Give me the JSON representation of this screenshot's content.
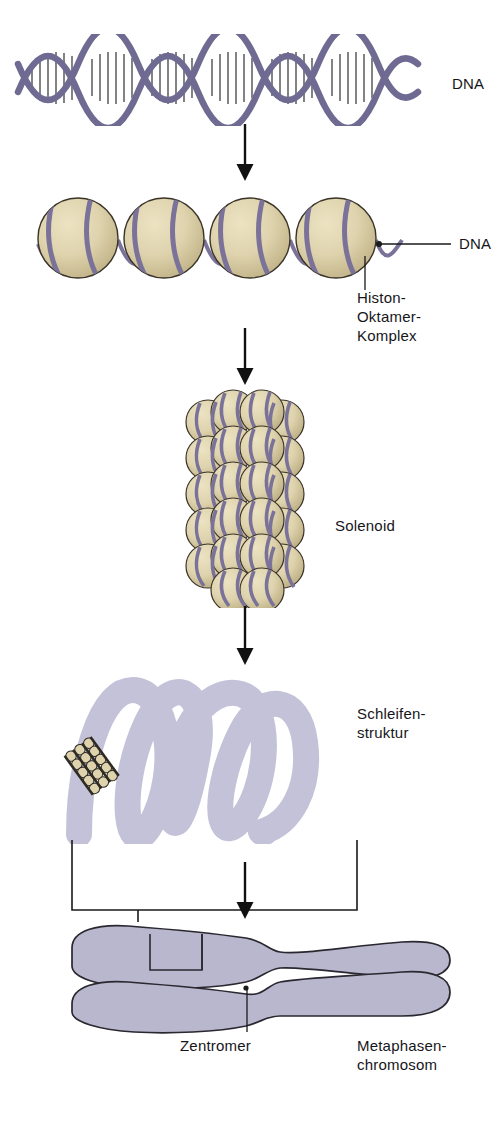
{
  "figure": {
    "title_visible": false,
    "language": "de",
    "background": "#ffffff",
    "colors": {
      "dna_helix": "#6f6a92",
      "helix_rung": "#1d1d22",
      "histone_sphere": "#ded3ad",
      "histone_sphere_shade": "#c9bc8f",
      "histone_outline": "#3a3328",
      "dna_wrap": "#7a7299",
      "loop_structure": "#c3c2d8",
      "chromosome_fill": "#b9b7cd",
      "chromosome_outline": "#2a2730",
      "arrow": "#111111",
      "leader_line": "#1a1a1a",
      "mini_solenoid_dark": "#2e2b24",
      "mini_solenoid_bead": "#ded3ad"
    }
  },
  "stages": [
    {
      "id": "dna-double-helix",
      "label": "DNA",
      "label_x": 452,
      "label_y": 83,
      "description": "DNA double helix",
      "turns": 6,
      "has_leader": false
    },
    {
      "id": "nucleosomes",
      "label": "DNA",
      "label_x": 459,
      "label_y": 249,
      "secondary_label": "Histon-\nOktamer-\nKomplex",
      "secondary_label_lines": [
        "Histon-",
        "Oktamer-",
        "Komplex"
      ],
      "secondary_label_x": 357,
      "secondary_label_y": 299,
      "bead_count": 4,
      "has_leader": true
    },
    {
      "id": "solenoid",
      "label": "Solenoid",
      "label_x": 335,
      "label_y": 516,
      "rows": 7,
      "description": "30 nm solenoid fibre, stacked nucleosomes"
    },
    {
      "id": "loop-structure",
      "label": "Schleifen-\nstruktur",
      "label_lines": [
        "Schleifen-",
        "struktur"
      ],
      "label_x": 357,
      "label_y": 713,
      "loops": 4,
      "description": "Looped domain structure with attached solenoid"
    },
    {
      "id": "metaphase-chromosome",
      "label": "Metaphasen-\nchromosom",
      "label_lines": [
        "Metaphasen-",
        "chromosom"
      ],
      "label_x": 357,
      "label_y": 1046,
      "centromere_label": "Zentromer",
      "centromere_label_x": 180,
      "centromere_label_y": 1046,
      "chromatids": 2,
      "description": "Metaphase chromosome with two sister chromatids"
    }
  ],
  "arrows": [
    {
      "id": "arrow-1",
      "from": "dna-double-helix",
      "to": "nucleosomes",
      "x": 245,
      "y_top": 126,
      "y_bottom": 178
    },
    {
      "id": "arrow-2",
      "from": "nucleosomes",
      "to": "solenoid",
      "x": 245,
      "y_top": 330,
      "y_bottom": 382
    },
    {
      "id": "arrow-3",
      "from": "solenoid",
      "to": "loop-structure",
      "x": 245,
      "y_top": 608,
      "y_bottom": 662
    },
    {
      "id": "arrow-4",
      "from": "loop-structure",
      "to": "metaphase-chromosome",
      "x": 245,
      "y_top": 862,
      "y_bottom": 916
    }
  ],
  "connectors": [
    {
      "id": "bracket-loop-to-chromosome",
      "description": "bracket linking loop structure region to chromatid segment"
    },
    {
      "id": "leader-dna-nucleosome",
      "description": "leader line from linker DNA to DNA label"
    },
    {
      "id": "leader-histone",
      "description": "leader line from histone sphere to Histon-Oktamer-Komplex label"
    },
    {
      "id": "leader-centromere",
      "description": "leader line from centromere to Zentromer label"
    }
  ]
}
